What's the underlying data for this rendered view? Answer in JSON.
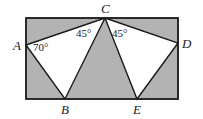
{
  "figure": {
    "canvas": {
      "width": 203,
      "height": 119
    },
    "colors": {
      "background": "#ffffff",
      "shaded_region": "#b3b3b3",
      "triangle_fill": "#ffffff",
      "stroke": "#1a1a1a",
      "label_text": "#1a1a1a"
    },
    "rectangle": {
      "name": "outer-rectangle",
      "x": 26,
      "y": 18,
      "width": 152,
      "height": 81
    },
    "points": [
      {
        "id": "A",
        "label": "A",
        "x": 26,
        "y": 45,
        "label_x": 13,
        "label_y": 39
      },
      {
        "id": "B",
        "label": "B",
        "x": 65,
        "y": 99,
        "label_x": 61,
        "label_y": 103
      },
      {
        "id": "C",
        "label": "C",
        "x": 105,
        "y": 18,
        "label_x": 101,
        "label_y": 2
      },
      {
        "id": "D",
        "label": "D",
        "x": 178,
        "y": 43,
        "label_x": 182,
        "label_y": 37
      },
      {
        "id": "E",
        "label": "E",
        "x": 137,
        "y": 99,
        "label_x": 133,
        "label_y": 103
      }
    ],
    "triangles": [
      {
        "name": "triangle-ACB",
        "vertices": "A,C,B",
        "polygon": "26,45 105,18 65,99"
      },
      {
        "name": "triangle-CDE",
        "vertices": "C,D,E",
        "polygon": "105,18 178,43 137,99"
      }
    ],
    "angles": [
      {
        "id": "angle-A",
        "label": "70°",
        "at_vertex": "A",
        "value": 70,
        "label_x": 33,
        "label_y": 42
      },
      {
        "id": "angle-C1",
        "label": "45°",
        "at_vertex": "C",
        "value": 45,
        "label_x": 76,
        "label_y": 28
      },
      {
        "id": "angle-C2",
        "label": "45°",
        "at_vertex": "C",
        "value": 45,
        "label_x": 112,
        "label_y": 28
      }
    ],
    "segments": [
      {
        "name": "segment-AC",
        "from": "A",
        "to": "C"
      },
      {
        "name": "segment-CB",
        "from": "C",
        "to": "B"
      },
      {
        "name": "segment-BA",
        "from": "B",
        "to": "A"
      },
      {
        "name": "segment-CD",
        "from": "C",
        "to": "D"
      },
      {
        "name": "segment-DE",
        "from": "D",
        "to": "E"
      },
      {
        "name": "segment-EC",
        "from": "E",
        "to": "C"
      }
    ]
  }
}
